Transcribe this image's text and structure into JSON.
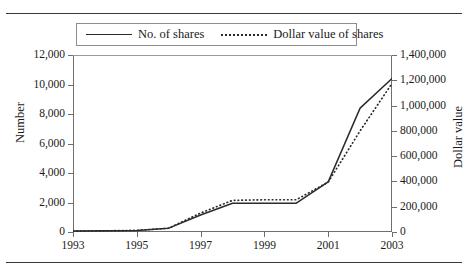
{
  "figure": {
    "partial_caption_top": ""
  },
  "legend": {
    "position": "top-center",
    "items": [
      {
        "label": "No. of shares",
        "style": "solid",
        "icon": "solid-line-swatch"
      },
      {
        "label": "Dollar value of shares",
        "style": "dotted",
        "icon": "dotted-line-swatch"
      }
    ]
  },
  "chart_data": {
    "type": "line",
    "title": "",
    "xlabel": "",
    "ylabel": "Number",
    "y2label": "Dollar value",
    "grid": false,
    "legend_position": "top-center",
    "x": [
      1993,
      1994,
      1995,
      1996,
      1997,
      1998,
      1999,
      2000,
      2001,
      2002,
      2003
    ],
    "xlim": [
      1993,
      2003
    ],
    "xticks": [
      1993,
      1995,
      1997,
      1999,
      2001,
      2003
    ],
    "xtick_labels": [
      "1993",
      "1995",
      "1997",
      "1999",
      "2001",
      "2003"
    ],
    "ylim": [
      0,
      12000
    ],
    "yticks": [
      0,
      2000,
      4000,
      6000,
      8000,
      10000,
      12000
    ],
    "ytick_labels": [
      "0",
      "2,000",
      "4,000",
      "6,000",
      "8,000",
      "10,000",
      "12,000"
    ],
    "y2lim": [
      0,
      1400000
    ],
    "y2ticks": [
      0,
      200000,
      400000,
      600000,
      800000,
      1000000,
      1200000,
      1400000
    ],
    "y2tick_labels": [
      "0",
      "200,000",
      "400,000",
      "600,000",
      "800,000",
      "1,000,000",
      "1,200,000",
      "1,400,000"
    ],
    "series": [
      {
        "name": "No. of shares",
        "axis": "left",
        "style": "solid",
        "values": [
          60,
          80,
          110,
          260,
          1150,
          1950,
          1950,
          1950,
          3400,
          8400,
          10400
        ]
      },
      {
        "name": "Dollar value of shares",
        "axis": "right",
        "style": "dotted",
        "values": [
          7000,
          9000,
          13000,
          30000,
          150000,
          250000,
          255000,
          255000,
          395000,
          800000,
          1175000
        ]
      }
    ]
  },
  "axes": {
    "left_title": "Number",
    "right_title": "Dollar value"
  }
}
